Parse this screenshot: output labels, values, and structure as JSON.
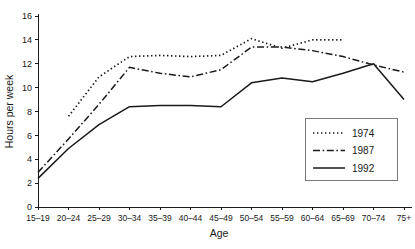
{
  "chart_data": {
    "type": "line",
    "title": "",
    "xlabel": "Age",
    "ylabel": "Hours per week",
    "categories": [
      "15–19",
      "20–24",
      "25–29",
      "30–34",
      "35–39",
      "40–44",
      "45–49",
      "50–54",
      "55–59",
      "60–64",
      "65–69",
      "70–74",
      "75+"
    ],
    "ylim": [
      0,
      16
    ],
    "yticks": [
      0,
      2,
      4,
      6,
      8,
      10,
      12,
      14,
      16
    ],
    "ytick_labels": [
      "0",
      "2",
      "4",
      "6",
      "8",
      "10",
      "12",
      "14",
      "16"
    ],
    "grid": false,
    "legend_position": "bottom-right",
    "series": [
      {
        "name": "1974",
        "style": "dotted",
        "x": [
          "20–24",
          "25–29",
          "30–34",
          "35–39",
          "40–44",
          "45–49",
          "50–54",
          "55–59",
          "60–64",
          "65–69"
        ],
        "values": [
          7.6,
          10.9,
          12.6,
          12.7,
          12.6,
          12.7,
          14.1,
          13.3,
          14.0,
          14.0
        ]
      },
      {
        "name": "1987",
        "style": "dash-dot",
        "x": [
          "15–19",
          "20–24",
          "25–29",
          "30–34",
          "35–39",
          "40–44",
          "45–49",
          "50–54",
          "55–59",
          "60–64",
          "65–69",
          "70–74",
          "75+"
        ],
        "values": [
          2.9,
          5.7,
          8.6,
          11.7,
          11.2,
          10.9,
          11.5,
          13.4,
          13.4,
          13.1,
          12.6,
          11.9,
          11.3
        ]
      },
      {
        "name": "1992",
        "style": "solid",
        "x": [
          "15–19",
          "20–24",
          "25–29",
          "30–34",
          "35–39",
          "40–44",
          "45–49",
          "50–54",
          "55–59",
          "60–64",
          "65–69",
          "70–74",
          "75+"
        ],
        "values": [
          2.4,
          4.9,
          6.9,
          8.4,
          8.5,
          8.5,
          8.4,
          10.4,
          10.8,
          10.5,
          11.2,
          12.0,
          9.0
        ]
      }
    ]
  },
  "legend": {
    "entries": [
      {
        "label": "1974",
        "style": "dotted"
      },
      {
        "label": "1987",
        "style": "dash-dot"
      },
      {
        "label": "1992",
        "style": "solid"
      }
    ]
  },
  "colors": {
    "ink": "#1a1a1a",
    "legend_border": "#7a7a7a",
    "background": "#ffffff"
  }
}
